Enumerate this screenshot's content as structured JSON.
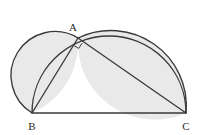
{
  "figure": {
    "background_color": "#ffffff",
    "stroke_color": "#3a3a3a",
    "lune_fill_color": "#e9e9e9",
    "label_color": "#2b2b2b"
  },
  "vertices": {
    "A": {
      "label": "A",
      "x": 78,
      "y": 38,
      "label_x": 73,
      "label_y": 31
    },
    "B": {
      "label": "B",
      "x": 32,
      "y": 113,
      "label_x": 32,
      "label_y": 130
    },
    "C": {
      "label": "C",
      "x": 186,
      "y": 113,
      "label_x": 186,
      "label_y": 130
    }
  },
  "segments": [
    {
      "name": "side-BC",
      "from": "B",
      "to": "C"
    },
    {
      "name": "side-AB",
      "from": "A",
      "to": "B"
    },
    {
      "name": "side-AC",
      "from": "A",
      "to": "C"
    }
  ],
  "arcs": [
    {
      "name": "semicircle-on-BC",
      "diameter": "BC",
      "center_x": 109,
      "center_y": 113,
      "radius": 77
    },
    {
      "name": "semicircle-on-AB",
      "diameter": "AB",
      "center_x": 55,
      "center_y": 75.5,
      "radius": 43.5
    },
    {
      "name": "semicircle-on-AC",
      "diameter": "AC",
      "center_x": 132,
      "center_y": 75.5,
      "radius": 75.5
    }
  ],
  "shaded_regions": [
    {
      "name": "lune-left",
      "bounded_by": [
        "semicircle-on-AB",
        "semicircle-on-BC"
      ]
    },
    {
      "name": "lune-right",
      "bounded_by": [
        "semicircle-on-AC",
        "semicircle-on-BC"
      ]
    }
  ],
  "markers": {
    "right_angle": {
      "name": "right-angle-at-A",
      "at_vertex": "A",
      "size": 8
    }
  }
}
